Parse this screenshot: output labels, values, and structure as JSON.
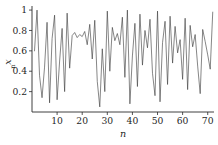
{
  "chart_data": {
    "type": "line",
    "title": "",
    "subtitle": "",
    "xlabel": "n",
    "ylabel": "x",
    "ylabel_subscript": "n",
    "ylabel_full": "x_n",
    "xlim": [
      0,
      72.5
    ],
    "ylim": [
      0.0,
      1.04
    ],
    "grid": false,
    "legend": null,
    "legend_position": "none",
    "line_color": "#3a3a3a",
    "axis_color": "#2b2b2b",
    "background_color": "#ffffff",
    "xticks": [
      10,
      20,
      30,
      40,
      50,
      60,
      70
    ],
    "xtick_labels": [
      "10",
      "20",
      "30",
      "40",
      "50",
      "60",
      "70"
    ],
    "yticks": [
      0.2,
      0.4,
      0.6,
      0.8,
      1
    ],
    "ytick_labels": [
      "0.2",
      "0.4",
      "0.6",
      "0.8",
      "1"
    ],
    "x": [
      1,
      2,
      3,
      4,
      5,
      6,
      7,
      8,
      9,
      10,
      11,
      12,
      13,
      14,
      15,
      16,
      17,
      18,
      19,
      20,
      21,
      22,
      23,
      24,
      25,
      26,
      27,
      28,
      29,
      30,
      31,
      32,
      33,
      34,
      35,
      36,
      37,
      38,
      39,
      40,
      41,
      42,
      43,
      44,
      45,
      46,
      47,
      48,
      49,
      50,
      51,
      52,
      53,
      54,
      55,
      56,
      57,
      58,
      59,
      60,
      61,
      62,
      63,
      64,
      65,
      66,
      67,
      68,
      69,
      70,
      71,
      72
    ],
    "values": [
      0.6,
      1.0,
      0.36,
      0.14,
      0.44,
      0.88,
      0.09,
      0.72,
      0.95,
      0.12,
      0.5,
      0.82,
      0.2,
      0.97,
      0.43,
      0.75,
      0.78,
      0.73,
      0.76,
      0.74,
      0.79,
      0.66,
      0.86,
      0.52,
      0.9,
      0.3,
      0.05,
      0.62,
      0.2,
      0.99,
      0.4,
      0.83,
      0.7,
      0.77,
      0.66,
      0.93,
      0.34,
      1.0,
      0.08,
      0.55,
      0.87,
      0.25,
      0.96,
      0.46,
      0.8,
      0.63,
      0.91,
      0.38,
      0.16,
      0.99,
      0.1,
      0.68,
      0.89,
      0.27,
      0.94,
      0.48,
      0.84,
      0.58,
      0.71,
      0.32,
      0.92,
      0.22,
      0.85,
      0.64,
      0.76,
      0.45,
      0.18,
      0.81,
      0.69,
      0.56,
      0.42,
      0.98
    ],
    "series": [
      {
        "name": "x_n",
        "values": [
          0.6,
          1.0,
          0.36,
          0.14,
          0.44,
          0.88,
          0.09,
          0.72,
          0.95,
          0.12,
          0.5,
          0.82,
          0.2,
          0.97,
          0.43,
          0.75,
          0.78,
          0.73,
          0.76,
          0.74,
          0.79,
          0.66,
          0.86,
          0.52,
          0.9,
          0.3,
          0.05,
          0.62,
          0.2,
          0.99,
          0.4,
          0.83,
          0.7,
          0.77,
          0.66,
          0.93,
          0.34,
          1.0,
          0.08,
          0.55,
          0.87,
          0.25,
          0.96,
          0.46,
          0.8,
          0.63,
          0.91,
          0.38,
          0.16,
          0.99,
          0.1,
          0.68,
          0.89,
          0.27,
          0.94,
          0.48,
          0.84,
          0.58,
          0.71,
          0.32,
          0.92,
          0.22,
          0.85,
          0.64,
          0.76,
          0.45,
          0.18,
          0.81,
          0.69,
          0.56,
          0.42,
          0.98
        ]
      }
    ]
  }
}
